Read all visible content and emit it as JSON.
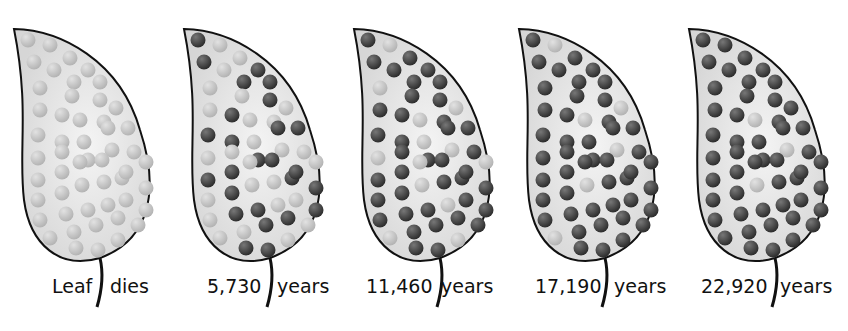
{
  "diagram": {
    "colors": {
      "undecayed_atom": "#b4b4b4",
      "decayed_atom": "#2e2e2e",
      "leaf_fill": "#d6d6d6",
      "leaf_outline": "#111111"
    },
    "panels": [
      {
        "left_label": "Leaf",
        "right_label": "dies",
        "decayed_fraction": 0
      },
      {
        "left_label": "5,730",
        "right_label": "years",
        "decayed_fraction": 0.5
      },
      {
        "left_label": "11,460",
        "right_label": "years",
        "decayed_fraction": 0.75
      },
      {
        "left_label": "17,190",
        "right_label": "years",
        "decayed_fraction": 0.875
      },
      {
        "left_label": "22,920",
        "right_label": "years",
        "decayed_fraction": 0.9375
      }
    ]
  }
}
